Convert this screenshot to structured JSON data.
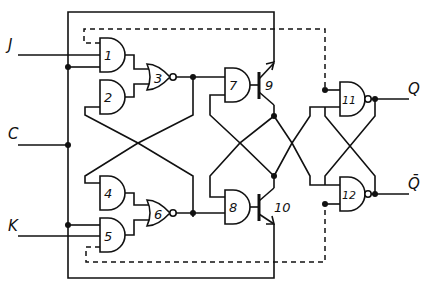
{
  "diagram": {
    "inputs": [
      {
        "id": "J",
        "label": "J"
      },
      {
        "id": "C",
        "label": "C"
      },
      {
        "id": "K",
        "label": "K"
      }
    ],
    "outputs": [
      {
        "id": "Q",
        "label": "Q"
      },
      {
        "id": "Qbar",
        "label": "Q̄"
      }
    ],
    "gates": [
      {
        "id": "1",
        "type": "AND",
        "label": "1"
      },
      {
        "id": "2",
        "type": "AND",
        "label": "2"
      },
      {
        "id": "3",
        "type": "NOR",
        "label": "3"
      },
      {
        "id": "4",
        "type": "AND",
        "label": "4"
      },
      {
        "id": "5",
        "type": "AND",
        "label": "5"
      },
      {
        "id": "6",
        "type": "NOR",
        "label": "6"
      },
      {
        "id": "7",
        "type": "AND",
        "label": "7"
      },
      {
        "id": "8",
        "type": "AND",
        "label": "8"
      },
      {
        "id": "11",
        "type": "NAND",
        "label": "11"
      },
      {
        "id": "12",
        "type": "NAND",
        "label": "12"
      }
    ],
    "transistors": [
      {
        "id": "9",
        "label": "9"
      },
      {
        "id": "10",
        "label": "10"
      }
    ],
    "colors": {
      "ink": "#111111",
      "background": "#ffffff"
    }
  }
}
